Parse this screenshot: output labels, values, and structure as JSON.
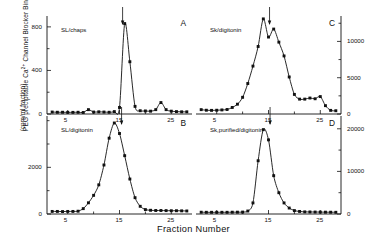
{
  "figure": {
    "ylabel_line1": "PEG precipitable Ca",
    "ylabel_sup": "2+",
    "ylabel_line1b": " Channel Blocker Binding Site",
    "ylabel_line2": "(cpm/ml fraction)",
    "xlabel": "Fraction Number",
    "ink_color": "#111111",
    "background": "#ffffff"
  },
  "chart_data": [
    {
      "type": "line",
      "panel": "A",
      "title": "SL/chaps",
      "xlabel": "Fraction Number",
      "ylabel": "PEG precipitable Ca2+ Channel Blocker Binding Site (cpm/ml fraction)",
      "xlim": [
        1,
        29
      ],
      "ylim": [
        0,
        900
      ],
      "xticks": [
        5,
        15,
        25
      ],
      "yticks": [
        0,
        400,
        800
      ],
      "grid": false,
      "marker": "filled-square",
      "arrow_at_x": 15.6,
      "x": [
        2,
        3,
        4,
        5,
        6,
        7,
        8,
        9,
        10,
        11,
        12,
        13,
        14,
        15,
        16,
        17,
        18,
        19,
        20,
        21,
        22,
        23,
        24,
        25,
        26,
        27,
        28
      ],
      "values": [
        18,
        16,
        16,
        15,
        15,
        16,
        14,
        40,
        18,
        20,
        18,
        16,
        22,
        60,
        830,
        480,
        70,
        30,
        28,
        26,
        40,
        105,
        40,
        26,
        22,
        20,
        20
      ]
    },
    {
      "type": "line",
      "panel": "B",
      "title": "SL/digitonin",
      "xlabel": "Fraction Number",
      "ylabel": "PEG precipitable Ca2+ Channel Blocker Binding Site (cpm/ml fraction)",
      "xlim": [
        1,
        29
      ],
      "ylim": [
        0,
        4200
      ],
      "xticks": [
        5,
        15,
        25
      ],
      "yticks": [
        0,
        2000
      ],
      "grid": false,
      "marker": "filled-square",
      "arrow_at_x": 15.4,
      "x": [
        2,
        3,
        4,
        5,
        6,
        7,
        8,
        9,
        10,
        11,
        12,
        13,
        14,
        15,
        16,
        17,
        18,
        19,
        20,
        21,
        22,
        23,
        24,
        25,
        26,
        27,
        28
      ],
      "values": [
        110,
        110,
        105,
        110,
        110,
        120,
        230,
        480,
        800,
        1250,
        2100,
        3250,
        3900,
        3450,
        2500,
        1500,
        700,
        330,
        190,
        160,
        150,
        150,
        145,
        140,
        140,
        135,
        130
      ]
    },
    {
      "type": "line",
      "panel": "C",
      "title": "Sk/digitonin",
      "xlabel": "Fraction Number",
      "ylabel": "",
      "xlim": [
        1,
        29
      ],
      "ylim": [
        0,
        13500
      ],
      "xticks": [
        5,
        15,
        25
      ],
      "yticks": [
        0,
        5000,
        10000
      ],
      "grid": false,
      "marker": "filled-square",
      "arrow_at_x": 15.2,
      "x": [
        2,
        3,
        4,
        5,
        6,
        7,
        8,
        9,
        10,
        11,
        12,
        13,
        14,
        15,
        16,
        17,
        18,
        19,
        20,
        21,
        22,
        23,
        24,
        25,
        26,
        27,
        28
      ],
      "values": [
        600,
        520,
        500,
        520,
        560,
        620,
        900,
        1350,
        2300,
        4200,
        6600,
        9300,
        13100,
        10600,
        11700,
        9900,
        8000,
        5100,
        2700,
        2050,
        2050,
        2200,
        2100,
        2400,
        1150,
        500,
        450
      ]
    },
    {
      "type": "line",
      "panel": "D",
      "title": "Sk,purified/digitonin",
      "xlabel": "Fraction Number",
      "ylabel": "",
      "xlim": [
        1,
        29
      ],
      "ylim": [
        0,
        23000
      ],
      "xticks": [
        5,
        15,
        25
      ],
      "yticks": [
        0,
        10000,
        20000
      ],
      "grid": false,
      "marker": "filled-square",
      "arrow_at_x": 15.3,
      "x": [
        2,
        3,
        4,
        5,
        6,
        7,
        8,
        9,
        10,
        11,
        12,
        13,
        14,
        15,
        16,
        17,
        18,
        19,
        20,
        21,
        22,
        23,
        24,
        25,
        26,
        27,
        28
      ],
      "values": [
        420,
        400,
        400,
        400,
        400,
        400,
        420,
        430,
        450,
        700,
        2600,
        12500,
        19800,
        17400,
        9000,
        5000,
        2600,
        1400,
        800,
        600,
        500,
        480,
        460,
        450,
        430,
        420,
        400
      ]
    }
  ]
}
